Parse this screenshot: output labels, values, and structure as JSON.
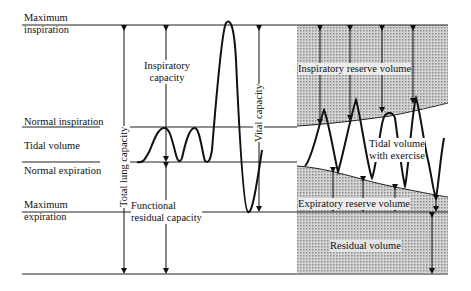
{
  "diagram": {
    "left_labels": {
      "max_inspiration": [
        "Maximum",
        "inspiration"
      ],
      "normal_inspiration": "Normal inspiration",
      "tidal_volume": "Tidal volume",
      "normal_expiration": "Normal expiration",
      "max_expiration": [
        "Maximum",
        "expiration"
      ]
    },
    "capacities": {
      "total_lung_capacity": "Total lung capacity",
      "inspiratory_capacity": [
        "Inspiratory",
        "capacity"
      ],
      "vital_capacity": "Vital capacity",
      "functional_residual_capacity": [
        "Functional",
        "residual capacity"
      ]
    },
    "exercise_region": {
      "inspiratory_reserve_volume": "Inspiratory reserve volume",
      "tidal_volume_with_exercise": [
        "Tidal volume",
        "with exercise"
      ],
      "expiratory_reserve_volume": "Expiratory reserve volume",
      "residual_volume": "Residual volume"
    },
    "colors": {
      "line": "#111111",
      "shade": "#b5b5b5",
      "background": "#ffffff"
    }
  }
}
